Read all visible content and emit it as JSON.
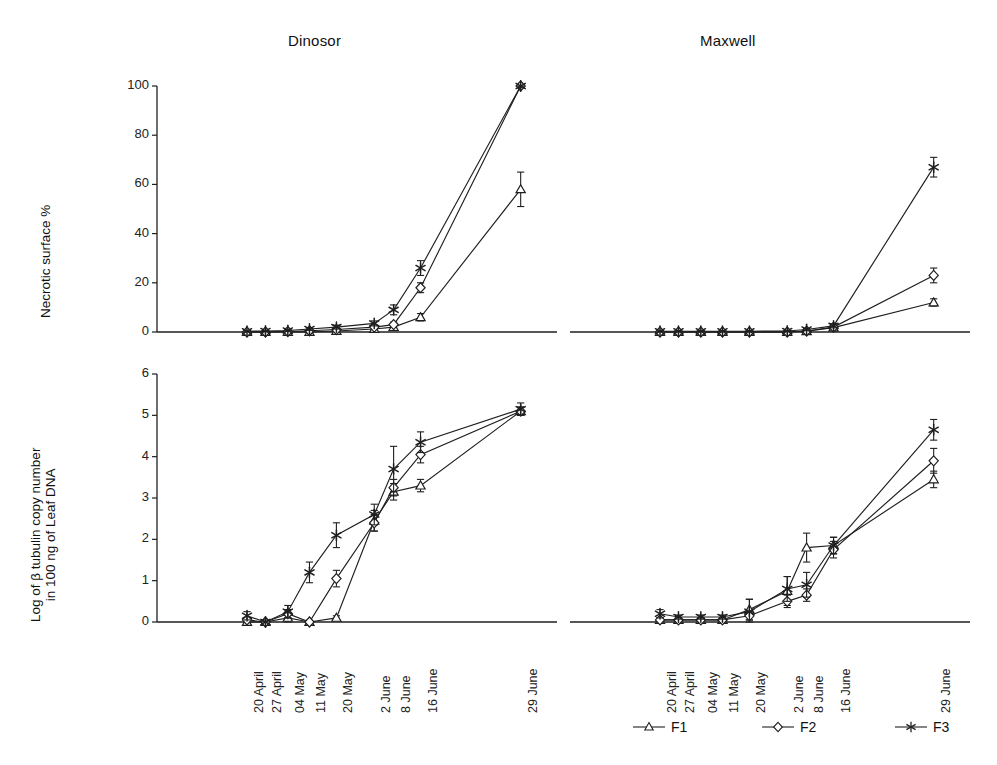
{
  "figure": {
    "panels": [
      {
        "id": "dinosor",
        "title": "Dinosor"
      },
      {
        "id": "maxwell",
        "title": "Maxwell"
      }
    ],
    "y_axis_top_label": "Necrotic surface %",
    "y_axis_bottom_label_line1": "Log of β tubulin copy number",
    "y_axis_bottom_label_line2": "in 100 ng of Leaf DNA"
  },
  "legend": {
    "position": "bottom-right",
    "items": [
      {
        "name": "F1",
        "marker": "triangle"
      },
      {
        "name": "F2",
        "marker": "diamond"
      },
      {
        "name": "F3",
        "marker": "asterisk"
      }
    ]
  },
  "chart_data": [
    {
      "id": "dinosor-necrotic",
      "type": "line",
      "title": "Dinosor",
      "xlabel": "",
      "ylabel": "Necrotic surface %",
      "categories": [
        "20 April",
        "27 April",
        "04 May",
        "11 May",
        "20 May",
        "2 June",
        "8 June",
        "16 June",
        "29 June"
      ],
      "x_positions": [
        0.0,
        0.105,
        0.232,
        0.355,
        0.508,
        0.723,
        0.833,
        0.986,
        1.555
      ],
      "yticks": [
        0,
        20,
        40,
        60,
        80,
        100
      ],
      "ylim": [
        0,
        100
      ],
      "grid": false,
      "series": [
        {
          "name": "F1",
          "marker": "triangle",
          "values": [
            0,
            0,
            0,
            0,
            0.4,
            1.2,
            2.0,
            6.0,
            58.0
          ],
          "errors": [
            0,
            0,
            0,
            0,
            0.3,
            0.5,
            0.8,
            1.5,
            7.0
          ]
        },
        {
          "name": "F2",
          "marker": "diamond",
          "values": [
            0,
            0,
            0.2,
            0.5,
            1.0,
            2.0,
            3.0,
            18.0,
            100.0
          ],
          "errors": [
            0,
            0,
            0.2,
            0.3,
            0.5,
            0.8,
            1.0,
            2.0,
            0.5
          ]
        },
        {
          "name": "F3",
          "marker": "asterisk",
          "values": [
            0.3,
            0.4,
            0.6,
            1.2,
            2.0,
            3.5,
            9.0,
            26.0,
            100.0
          ],
          "errors": [
            0.2,
            0.2,
            0.3,
            0.5,
            0.8,
            1.0,
            2.0,
            3.0,
            0.5
          ]
        }
      ]
    },
    {
      "id": "maxwell-necrotic",
      "type": "line",
      "title": "Maxwell",
      "xlabel": "",
      "ylabel": "Necrotic surface %",
      "categories": [
        "20 April",
        "27 April",
        "04 May",
        "11 May",
        "20 May",
        "2 June",
        "8 June",
        "16 June",
        "29 June"
      ],
      "x_positions": [
        0.0,
        0.105,
        0.232,
        0.355,
        0.508,
        0.723,
        0.833,
        0.986,
        1.555
      ],
      "yticks": [
        0,
        20,
        40,
        60,
        80,
        100
      ],
      "ylim": [
        0,
        100
      ],
      "grid": false,
      "series": [
        {
          "name": "F1",
          "marker": "triangle",
          "values": [
            0,
            0,
            0,
            0,
            0,
            0,
            0.3,
            1.8,
            12.0
          ],
          "errors": [
            0,
            0,
            0,
            0,
            0,
            0,
            0.2,
            0.6,
            1.5
          ]
        },
        {
          "name": "F2",
          "marker": "diamond",
          "values": [
            0,
            0,
            0,
            0,
            0,
            0,
            0.4,
            2.0,
            23.0
          ],
          "errors": [
            0,
            0,
            0,
            0,
            0,
            0,
            0.2,
            0.6,
            3.0
          ]
        },
        {
          "name": "F3",
          "marker": "asterisk",
          "values": [
            0.3,
            0.3,
            0.3,
            0.3,
            0.3,
            0.4,
            1.0,
            2.5,
            67.0
          ],
          "errors": [
            0.2,
            0.2,
            0.2,
            0.2,
            0.2,
            0.2,
            0.4,
            0.8,
            4.0
          ]
        }
      ]
    },
    {
      "id": "dinosor-tubulin",
      "type": "line",
      "title": "Dinosor",
      "xlabel": "",
      "ylabel": "Log of β tubulin copy number in 100 ng of Leaf DNA",
      "categories": [
        "20 April",
        "27 April",
        "04 May",
        "11 May",
        "20 May",
        "2 June",
        "8 June",
        "16 June",
        "29 June"
      ],
      "x_positions": [
        0.0,
        0.105,
        0.232,
        0.355,
        0.508,
        0.723,
        0.833,
        0.986,
        1.555
      ],
      "yticks": [
        0,
        1,
        2,
        3,
        4,
        5,
        6
      ],
      "ylim": [
        0,
        6
      ],
      "grid": false,
      "series": [
        {
          "name": "F1",
          "marker": "triangle",
          "values": [
            0.0,
            0.0,
            0.1,
            0.0,
            0.1,
            2.45,
            3.15,
            3.3,
            5.1
          ],
          "errors": [
            0.0,
            0.0,
            0.1,
            0.0,
            0.05,
            0.25,
            0.2,
            0.15,
            0.1
          ]
        },
        {
          "name": "F2",
          "marker": "diamond",
          "values": [
            0.05,
            0.0,
            0.2,
            0.0,
            1.05,
            2.4,
            3.25,
            4.05,
            5.1
          ],
          "errors": [
            0.05,
            0.0,
            0.1,
            0.0,
            0.2,
            0.2,
            0.2,
            0.2,
            0.1
          ]
        },
        {
          "name": "F3",
          "marker": "asterisk",
          "values": [
            0.15,
            0.0,
            0.25,
            1.2,
            2.1,
            2.6,
            3.7,
            4.35,
            5.15
          ],
          "errors": [
            0.1,
            0.05,
            0.15,
            0.25,
            0.3,
            0.25,
            0.55,
            0.25,
            0.15
          ]
        }
      ]
    },
    {
      "id": "maxwell-tubulin",
      "type": "line",
      "title": "Maxwell",
      "xlabel": "",
      "ylabel": "Log of β tubulin copy number in 100 ng of Leaf DNA",
      "categories": [
        "20 April",
        "27 April",
        "04 May",
        "11 May",
        "20 May",
        "2 June",
        "8 June",
        "16 June",
        "29 June"
      ],
      "x_positions": [
        0.0,
        0.105,
        0.232,
        0.355,
        0.508,
        0.723,
        0.833,
        0.986,
        1.555
      ],
      "yticks": [
        0,
        1,
        2,
        3,
        4,
        5,
        6
      ],
      "ylim": [
        0,
        6
      ],
      "grid": false,
      "series": [
        {
          "name": "F1",
          "marker": "triangle",
          "values": [
            0.05,
            0.05,
            0.05,
            0.05,
            0.3,
            0.75,
            1.8,
            1.85,
            3.45
          ],
          "errors": [
            0.05,
            0.05,
            0.05,
            0.05,
            0.25,
            0.35,
            0.35,
            0.2,
            0.2
          ]
        },
        {
          "name": "F2",
          "marker": "diamond",
          "values": [
            0.05,
            0.05,
            0.05,
            0.05,
            0.15,
            0.5,
            0.65,
            1.75,
            3.9
          ],
          "errors": [
            0.05,
            0.05,
            0.05,
            0.05,
            0.1,
            0.15,
            0.15,
            0.2,
            0.3
          ]
        },
        {
          "name": "F3",
          "marker": "asterisk",
          "values": [
            0.2,
            0.12,
            0.12,
            0.12,
            0.25,
            0.8,
            0.9,
            1.85,
            4.65
          ],
          "errors": [
            0.1,
            0.05,
            0.05,
            0.05,
            0.3,
            0.3,
            0.3,
            0.2,
            0.25
          ]
        }
      ]
    }
  ]
}
